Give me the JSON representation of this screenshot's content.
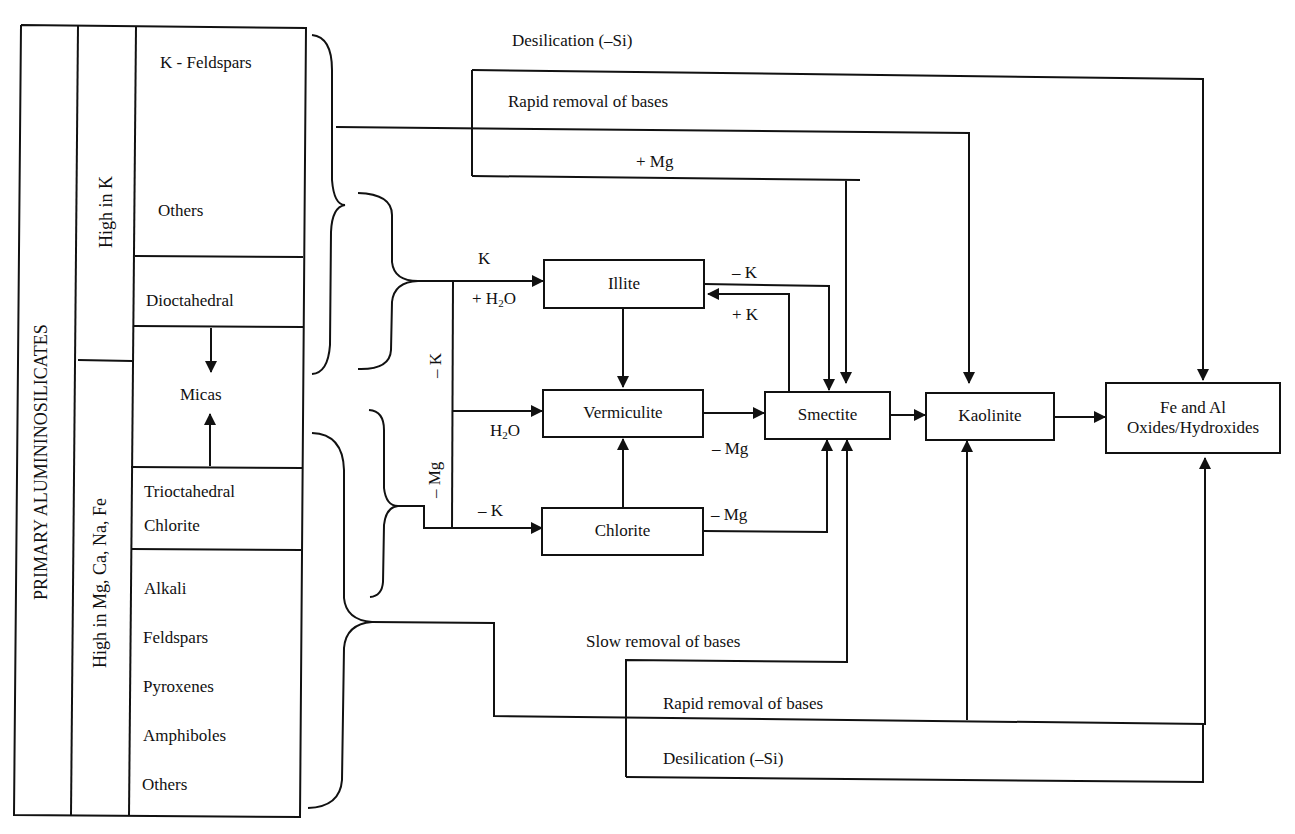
{
  "figure": {
    "table": {
      "outer_label": "PRIMARY ALUMININOSILICATES",
      "groups": [
        {
          "label": "High in K",
          "rows": [
            {
              "cell": "k-feldspars-others",
              "items": [
                "K - Feldspars",
                "Others"
              ]
            },
            {
              "cell": "dioctahedral",
              "items": [
                "Dioctahedral"
              ]
            }
          ]
        },
        {
          "label": "High in Mg, Ca, Na, Fe",
          "rows": [
            {
              "cell": "micas",
              "items": [
                "Micas"
              ]
            },
            {
              "cell": "trioctahedral-chlorite",
              "items": [
                "Trioctahedral",
                "Chlorite"
              ]
            },
            {
              "cell": "alkali-group",
              "items": [
                "Alkali",
                "Feldspars",
                "Pyroxenes",
                "Amphiboles",
                "Others"
              ]
            }
          ]
        }
      ]
    },
    "nodes": {
      "illite": "Illite",
      "vermiculite": "Vermiculite",
      "chlorite": "Chlorite",
      "smectite": "Smectite",
      "kaolinite": "Kaolinite",
      "oxides_line1": "Fe and Al",
      "oxides_line2": "Oxides/Hydroxides"
    },
    "edge_labels": {
      "top_desilication": "Desilication (–Si)",
      "top_rapid_removal": "Rapid removal of bases",
      "plus_mg": "+ Mg",
      "k_in": "K",
      "h2o_plus_prefix": "+ H",
      "h2o_plus_sub": "2",
      "h2o_plus_suffix": "O",
      "h2o_prefix": "H",
      "h2o_sub": "2",
      "h2o_suffix": "O",
      "minus_k_vertical": "– K",
      "minus_mg_vertical": "– Mg",
      "minus_k_chlorite": "– K",
      "illite_minus_k": "– K",
      "illite_plus_k": "+ K",
      "verm_minus_mg": "– Mg",
      "chlorite_minus_mg": "– Mg",
      "slow_removal": "Slow removal of bases",
      "bottom_rapid_removal": "Rapid removal of bases",
      "bottom_desilication": "Desilication (–Si)"
    },
    "colors": {
      "line": "#111111",
      "background": "#ffffff"
    }
  }
}
